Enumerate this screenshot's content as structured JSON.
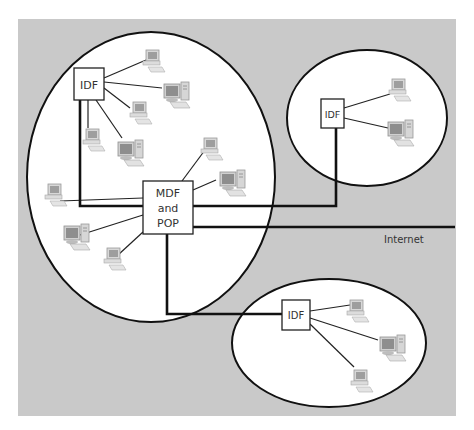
{
  "diagram": {
    "type": "network-topology",
    "background_color": "#c9c9c9",
    "internet_label": "Internet",
    "nodes": {
      "mdf": {
        "label_lines": [
          "MDF",
          "and",
          "POP"
        ]
      },
      "idf_main": {
        "label": "IDF"
      },
      "idf_top_right": {
        "label": "IDF"
      },
      "idf_bottom": {
        "label": "IDF"
      }
    },
    "zones": [
      {
        "id": "main-building",
        "contains": [
          "MDF and POP",
          "IDF"
        ],
        "computer_count": 10
      },
      {
        "id": "remote-top-right",
        "contains": [
          "IDF"
        ],
        "computer_count": 2
      },
      {
        "id": "remote-bottom",
        "contains": [
          "IDF"
        ],
        "computer_count": 3
      }
    ],
    "links": [
      {
        "from": "MDF and POP",
        "to": "IDF (main building)",
        "kind": "backbone"
      },
      {
        "from": "MDF and POP",
        "to": "IDF (top right)",
        "kind": "backbone"
      },
      {
        "from": "MDF and POP",
        "to": "IDF (bottom)",
        "kind": "backbone"
      },
      {
        "from": "MDF and POP",
        "to": "Internet",
        "kind": "backbone"
      }
    ]
  }
}
